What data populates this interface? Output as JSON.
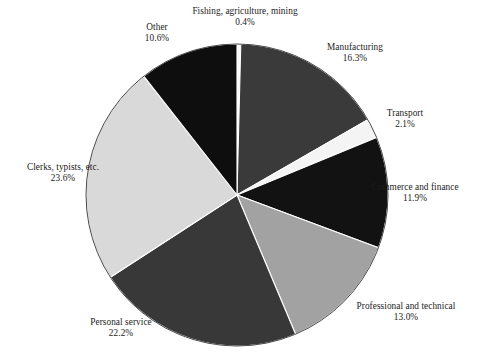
{
  "chart_data": {
    "type": "pie",
    "title": "",
    "subtitle": "",
    "xlabel": "",
    "ylabel": "",
    "legend_position": "none",
    "grid": false,
    "label_format": "name above, percentage below",
    "start_angle_deg": 0,
    "direction": "clockwise",
    "categories": [
      "Fishing, agriculture, mining",
      "Manufacturing",
      "Transport",
      "Commerce and finance",
      "Professional and technical",
      "Personal service",
      "Clerks, typists, etc.",
      "Other"
    ],
    "values": [
      0.4,
      16.3,
      2.1,
      11.9,
      13.0,
      22.2,
      23.6,
      10.6
    ],
    "value_labels": [
      "0.4%",
      "16.3%",
      "2.1%",
      "11.9%",
      "13.0%",
      "22.2%",
      "23.6%",
      "10.6%"
    ],
    "colors": [
      "#fbfbfb",
      "#3a3a3a",
      "#f4f4f4",
      "#121212",
      "#a2a2a2",
      "#383838",
      "#d9d9d9",
      "#0e0e0e"
    ],
    "slices": [
      {
        "name": "Fishing, agriculture, mining",
        "value": 0.4,
        "pct_label": "0.4%",
        "color": "#fbfbfb"
      },
      {
        "name": "Manufacturing",
        "value": 16.3,
        "pct_label": "16.3%",
        "color": "#3a3a3a"
      },
      {
        "name": "Transport",
        "value": 2.1,
        "pct_label": "2.1%",
        "color": "#f4f4f4"
      },
      {
        "name": "Commerce and finance",
        "value": 11.9,
        "pct_label": "11.9%",
        "color": "#121212"
      },
      {
        "name": "Professional and technical",
        "value": 13.0,
        "pct_label": "13.0%",
        "color": "#a2a2a2"
      },
      {
        "name": "Personal service",
        "value": 22.2,
        "pct_label": "22.2%",
        "color": "#383838"
      },
      {
        "name": "Clerks, typists, etc.",
        "value": 23.6,
        "pct_label": "23.6%",
        "color": "#d9d9d9"
      },
      {
        "name": "Other",
        "value": 10.6,
        "pct_label": "10.6%",
        "color": "#0e0e0e"
      }
    ]
  },
  "labels": {
    "fishing": {
      "name": "Fishing, agriculture, mining",
      "pct": "0.4%"
    },
    "manufacturing": {
      "name": "Manufacturing",
      "pct": "16.3%"
    },
    "transport": {
      "name": "Transport",
      "pct": "2.1%"
    },
    "commerce": {
      "name": "Commerce and finance",
      "pct": "11.9%"
    },
    "professional": {
      "name": "Professional and technical",
      "pct": "13.0%"
    },
    "personal": {
      "name": "Personal service",
      "pct": "22.2%"
    },
    "clerks": {
      "name": "Clerks, typists, etc.",
      "pct": "23.6%"
    },
    "other": {
      "name": "Other",
      "pct": "10.6%"
    }
  },
  "geometry": {
    "center_x": 237,
    "center_y": 195,
    "radius": 151,
    "outline_color": "#4a4a4a"
  }
}
